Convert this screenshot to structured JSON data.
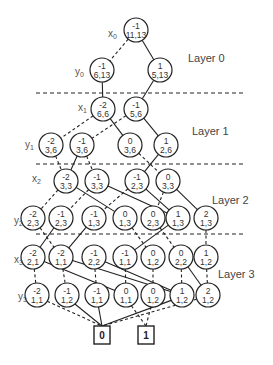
{
  "diagram": {
    "layers": [
      {
        "label": "Layer 0",
        "x": 188,
        "y": 62
      },
      {
        "label": "Layer 1",
        "x": 192,
        "y": 135
      },
      {
        "label": "Layer 2",
        "x": 212,
        "y": 204
      },
      {
        "label": "Layer 3",
        "x": 218,
        "y": 278
      }
    ],
    "separators_y": [
      93,
      164,
      234
    ],
    "variables": [
      {
        "name": "x",
        "sub": "0",
        "x": 108,
        "y": 37
      },
      {
        "name": "y",
        "sub": "0",
        "x": 75,
        "y": 75
      },
      {
        "name": "x",
        "sub": "1",
        "x": 78,
        "y": 111
      },
      {
        "name": "y",
        "sub": "1",
        "x": 25,
        "y": 148
      },
      {
        "name": "x",
        "sub": "2",
        "x": 32,
        "y": 182
      },
      {
        "name": "y",
        "sub": "2",
        "x": 14,
        "y": 224
      },
      {
        "name": "x",
        "sub": "3",
        "x": 14,
        "y": 263
      },
      {
        "name": "y",
        "sub": "3",
        "x": 18,
        "y": 300
      }
    ],
    "nodes": [
      {
        "id": "n0",
        "top": "-1",
        "bottom": "11,13",
        "cx": 136,
        "cy": 30
      },
      {
        "id": "n1",
        "top": "-1",
        "bottom": "6,13",
        "cx": 102,
        "cy": 70
      },
      {
        "id": "n2",
        "top": "1",
        "bottom": "5,13",
        "cx": 160,
        "cy": 70
      },
      {
        "id": "n3",
        "top": "-2",
        "bottom": "6,6",
        "cx": 103,
        "cy": 109
      },
      {
        "id": "n4",
        "top": "-1",
        "bottom": "5,6",
        "cx": 136,
        "cy": 109
      },
      {
        "id": "n5",
        "top": "-2",
        "bottom": "3,6",
        "cx": 51,
        "cy": 145
      },
      {
        "id": "n6",
        "top": "-1",
        "bottom": "3,6",
        "cx": 82,
        "cy": 145
      },
      {
        "id": "n7",
        "top": "0",
        "bottom": "3,6",
        "cx": 130,
        "cy": 145
      },
      {
        "id": "n8",
        "top": "1",
        "bottom": "2,6",
        "cx": 166,
        "cy": 145
      },
      {
        "id": "n9",
        "top": "-2",
        "bottom": "3,3",
        "cx": 66,
        "cy": 181
      },
      {
        "id": "n10",
        "top": "-1",
        "bottom": "3,3",
        "cx": 97,
        "cy": 181
      },
      {
        "id": "n11",
        "top": "-1",
        "bottom": "2,3",
        "cx": 137,
        "cy": 181
      },
      {
        "id": "n12",
        "top": "0",
        "bottom": "3,3",
        "cx": 168,
        "cy": 181
      },
      {
        "id": "n13",
        "top": "-2",
        "bottom": "2,3",
        "cx": 33,
        "cy": 218
      },
      {
        "id": "n14",
        "top": "-1",
        "bottom": "2,3",
        "cx": 61,
        "cy": 218
      },
      {
        "id": "n15",
        "top": "-1",
        "bottom": "1,3",
        "cx": 94,
        "cy": 218
      },
      {
        "id": "n16",
        "top": "0",
        "bottom": "1,3",
        "cx": 125,
        "cy": 218
      },
      {
        "id": "n17",
        "top": "0",
        "bottom": "2,3",
        "cx": 153,
        "cy": 218
      },
      {
        "id": "n18",
        "top": "1",
        "bottom": "1,3",
        "cx": 178,
        "cy": 218
      },
      {
        "id": "n19",
        "top": "2",
        "bottom": "1,3",
        "cx": 206,
        "cy": 218
      },
      {
        "id": "n20",
        "top": "-2",
        "bottom": "2,1",
        "cx": 33,
        "cy": 257
      },
      {
        "id": "n21",
        "top": "-2",
        "bottom": "1,1",
        "cx": 61,
        "cy": 257
      },
      {
        "id": "n22",
        "top": "-1",
        "bottom": "2,2",
        "cx": 94,
        "cy": 257
      },
      {
        "id": "n23",
        "top": "-1",
        "bottom": "1,1",
        "cx": 125,
        "cy": 257
      },
      {
        "id": "n24",
        "top": "0",
        "bottom": "1,2",
        "cx": 153,
        "cy": 257
      },
      {
        "id": "n25",
        "top": "0",
        "bottom": "2,2",
        "cx": 181,
        "cy": 257
      },
      {
        "id": "n26",
        "top": "1",
        "bottom": "1,2",
        "cx": 206,
        "cy": 257
      },
      {
        "id": "n27",
        "top": "-2",
        "bottom": "1,1",
        "cx": 37,
        "cy": 295
      },
      {
        "id": "n28",
        "top": "-1",
        "bottom": "1,2",
        "cx": 67,
        "cy": 295
      },
      {
        "id": "n29",
        "top": "-1",
        "bottom": "1,1",
        "cx": 97,
        "cy": 295
      },
      {
        "id": "n30",
        "top": "0",
        "bottom": "1,1",
        "cx": 126,
        "cy": 295
      },
      {
        "id": "n31",
        "top": "0",
        "bottom": "1,2",
        "cx": 153,
        "cy": 295
      },
      {
        "id": "n32",
        "top": "1",
        "bottom": "1,2",
        "cx": 182,
        "cy": 295
      },
      {
        "id": "n33",
        "top": "2",
        "bottom": "1,2",
        "cx": 208,
        "cy": 295
      }
    ],
    "terminals": [
      {
        "id": "t0",
        "label": "0",
        "cx": 102,
        "cy": 335
      },
      {
        "id": "t1",
        "label": "1",
        "cx": 146,
        "cy": 335
      }
    ],
    "edges": [
      {
        "from": "n0",
        "to": "n1",
        "style": "dashed"
      },
      {
        "from": "n0",
        "to": "n2",
        "style": "solid"
      },
      {
        "from": "n1",
        "to": "n3",
        "style": "solid"
      },
      {
        "from": "n2",
        "to": "n4",
        "style": "solid"
      },
      {
        "from": "n3",
        "to": "n5",
        "style": "dashed"
      },
      {
        "from": "n3",
        "to": "n7",
        "style": "solid"
      },
      {
        "from": "n4",
        "to": "n6",
        "style": "dashed"
      },
      {
        "from": "n4",
        "to": "n8",
        "style": "solid"
      },
      {
        "from": "n5",
        "to": "n9",
        "style": "dashed"
      },
      {
        "from": "n6",
        "to": "n9",
        "style": "solid"
      },
      {
        "from": "n6",
        "to": "n10",
        "style": "dashed"
      },
      {
        "from": "n7",
        "to": "n12",
        "style": "dashed"
      },
      {
        "from": "n8",
        "to": "n11",
        "style": "solid"
      },
      {
        "from": "n9",
        "to": "n13",
        "style": "dashed"
      },
      {
        "from": "n9",
        "to": "n16",
        "style": "solid"
      },
      {
        "from": "n10",
        "to": "n14",
        "style": "dashed"
      },
      {
        "from": "n10",
        "to": "n18",
        "style": "solid"
      },
      {
        "from": "n11",
        "to": "n15",
        "style": "dashed"
      },
      {
        "from": "n11",
        "to": "n18",
        "style": "solid"
      },
      {
        "from": "n12",
        "to": "n17",
        "style": "dashed"
      },
      {
        "from": "n12",
        "to": "n19",
        "style": "solid"
      },
      {
        "from": "n13",
        "to": "n21",
        "style": "dashed"
      },
      {
        "from": "n14",
        "to": "n20",
        "style": "solid"
      },
      {
        "from": "n15",
        "to": "n21",
        "style": "solid"
      },
      {
        "from": "n16",
        "to": "n24",
        "style": "dashed"
      },
      {
        "from": "n17",
        "to": "n25",
        "style": "dashed"
      },
      {
        "from": "n18",
        "to": "n23",
        "style": "solid"
      },
      {
        "from": "n19",
        "to": "n26",
        "style": "dashed"
      },
      {
        "from": "n20",
        "to": "n27",
        "style": "dashed"
      },
      {
        "from": "n20",
        "to": "n30",
        "style": "solid"
      },
      {
        "from": "n21",
        "to": "n28",
        "style": "dashed"
      },
      {
        "from": "n21",
        "to": "n32",
        "style": "solid"
      },
      {
        "from": "n22",
        "to": "n29",
        "style": "dashed"
      },
      {
        "from": "n22",
        "to": "n32",
        "style": "solid"
      },
      {
        "from": "n23",
        "to": "n30",
        "style": "dashed"
      },
      {
        "from": "n24",
        "to": "n31",
        "style": "dashed"
      },
      {
        "from": "n25",
        "to": "n32",
        "style": "dashed"
      },
      {
        "from": "n25",
        "to": "n33",
        "style": "solid"
      },
      {
        "from": "n26",
        "to": "n33",
        "style": "dashed"
      },
      {
        "from": "n27",
        "to": "t0",
        "style": "dashed"
      },
      {
        "from": "n28",
        "to": "t0",
        "style": "solid"
      },
      {
        "from": "n29",
        "to": "t0",
        "style": "solid"
      },
      {
        "from": "n30",
        "to": "t1",
        "style": "dashed"
      },
      {
        "from": "n31",
        "to": "t1",
        "style": "dashed"
      },
      {
        "from": "n32",
        "to": "t0",
        "style": "solid"
      },
      {
        "from": "n33",
        "to": "t0",
        "style": "dashed"
      }
    ]
  }
}
